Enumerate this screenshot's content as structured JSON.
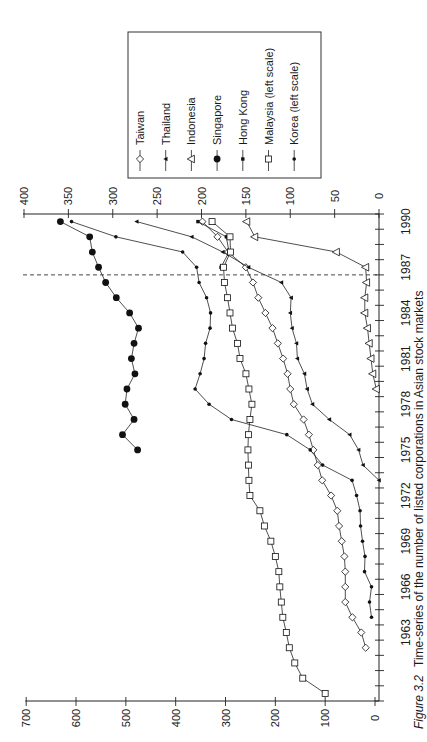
{
  "figure": {
    "label": "Figure 3.2",
    "caption": "Time-series of the number of listed corporations in Asian stock markets"
  },
  "legend": {
    "items": [
      {
        "label": "Taiwan",
        "marker": "open-diamond"
      },
      {
        "label": "Thailand",
        "marker": "filled-triangle"
      },
      {
        "label": "Indonesia",
        "marker": "open-triangle"
      },
      {
        "label": "Singapore",
        "marker": "filled-circle-large"
      },
      {
        "label": "Hong Kong",
        "marker": "filled-square"
      },
      {
        "label": "Malaysia (left scale)",
        "marker": "open-square"
      },
      {
        "label": "Korea (left scale)",
        "marker": "filled-circle-small"
      }
    ]
  },
  "chart_data": {
    "type": "line",
    "title": "Time-series of the number of listed corporations in Asian stock markets",
    "xlabel": "",
    "ylabel": "",
    "orientation": "rotated 90 degrees counter-clockwise (years run top-to-bottom from 1990 to 1958)",
    "xlim": [
      1958,
      1990
    ],
    "x_tick_labels": [
      1963,
      1966,
      1969,
      1972,
      1975,
      1978,
      1981,
      1984,
      1987,
      1990
    ],
    "right_axis": {
      "ylim": [
        0,
        400
      ],
      "ticks": [
        0,
        50,
        100,
        150,
        200,
        250,
        300,
        350,
        400
      ]
    },
    "left_axis": {
      "ylim": [
        0,
        700
      ],
      "ticks": [
        0,
        100,
        200,
        300,
        400,
        500,
        600,
        700
      ]
    },
    "grid": false,
    "legend_position": "boxed, upper area of rotated figure",
    "annotations": [
      {
        "type": "dashed-line",
        "x": 1986.5
      }
    ],
    "series": [
      {
        "name": "Taiwan",
        "axis": "right",
        "marker": "open-diamond",
        "x": [
          1962,
          1963,
          1964,
          1965,
          1966,
          1967,
          1968,
          1969,
          1970,
          1971,
          1972,
          1973,
          1974,
          1975,
          1976,
          1977,
          1978,
          1979,
          1980,
          1981,
          1982,
          1983,
          1984,
          1985,
          1986,
          1987,
          1988,
          1989,
          1990
        ],
        "values": [
          15,
          20,
          30,
          38,
          38,
          38,
          39,
          42,
          45,
          47,
          54,
          64,
          69,
          74,
          79,
          85,
          96,
          100,
          103,
          108,
          114,
          120,
          128,
          136,
          142,
          150,
          170,
          182,
          199
        ]
      },
      {
        "name": "Thailand",
        "axis": "right",
        "marker": "filled-triangle",
        "x": [
          1973,
          1974,
          1975,
          1976,
          1977,
          1978,
          1979,
          1980,
          1981,
          1982,
          1983,
          1984,
          1985,
          1986,
          1987,
          1988,
          1989,
          1990
        ],
        "values": [
          0,
          18,
          23,
          33,
          56,
          75,
          81,
          84,
          92,
          93,
          98,
          100,
          99,
          110,
          147,
          176,
          211,
          273
        ]
      },
      {
        "name": "Indonesia",
        "axis": "right",
        "marker": "open-triangle",
        "x": [
          1979,
          1980,
          1981,
          1982,
          1983,
          1984,
          1985,
          1986,
          1987,
          1988,
          1989,
          1990
        ],
        "values": [
          3,
          7,
          9,
          11,
          13,
          16,
          16,
          14,
          15,
          48,
          140,
          149
        ]
      },
      {
        "name": "Singapore",
        "axis": "right",
        "marker": "filled-circle-large",
        "x": [
          1975,
          1976,
          1977,
          1978,
          1979,
          1980,
          1981,
          1982,
          1983,
          1984,
          1985,
          1986,
          1987,
          1988,
          1989,
          1990
        ],
        "values": [
          272,
          289,
          276,
          286,
          284,
          275,
          279,
          276,
          271,
          281,
          296,
          308,
          316,
          323,
          326,
          359
        ]
      },
      {
        "name": "Hong Kong",
        "axis": "right",
        "marker": "filled-square",
        "x": [
          1987,
          1988,
          1989,
          1990
        ],
        "values": [
          178,
          169,
          172,
          204
        ]
      },
      {
        "name": "Malaysia (left scale)",
        "axis": "left",
        "marker": "open-square",
        "x": [
          1959,
          1960,
          1961,
          1962,
          1963,
          1964,
          1965,
          1966,
          1967,
          1968,
          1969,
          1970,
          1971,
          1972,
          1973,
          1974,
          1975,
          1976,
          1977,
          1978,
          1979,
          1980,
          1981,
          1982,
          1983,
          1984,
          1985,
          1986,
          1987,
          1988,
          1989,
          1990
        ],
        "values": [
          100,
          145,
          161,
          172,
          178,
          185,
          188,
          191,
          193,
          200,
          209,
          222,
          231,
          251,
          253,
          254,
          255,
          254,
          251,
          247,
          253,
          259,
          271,
          276,
          286,
          291,
          296,
          302,
          304,
          290,
          291,
          327
        ]
      },
      {
        "name": "Korea (left scale)",
        "axis": "left",
        "marker": "filled-circle-small",
        "x": [
          1964,
          1965,
          1966,
          1967,
          1968,
          1969,
          1970,
          1971,
          1972,
          1973,
          1974,
          1975,
          1976,
          1977,
          1978,
          1979,
          1980,
          1981,
          1982,
          1983,
          1984,
          1985,
          1986,
          1987,
          1988,
          1989,
          1990
        ],
        "values": [
          7,
          11,
          7,
          21,
          20,
          25,
          29,
          30,
          37,
          46,
          105,
          130,
          177,
          288,
          333,
          361,
          351,
          343,
          340,
          331,
          330,
          338,
          353,
          358,
          386,
          520,
          609
        ]
      }
    ]
  }
}
